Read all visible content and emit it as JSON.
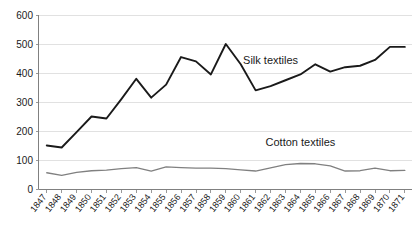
{
  "chart_data": {
    "type": "line",
    "title": "",
    "subtitle": "",
    "xlabel": "",
    "ylabel": "",
    "ylim": [
      0,
      600
    ],
    "ytick_values": [
      0,
      100,
      200,
      300,
      400,
      500,
      600
    ],
    "ytick_labels": [
      "0",
      "100",
      "200",
      "300",
      "400",
      "500",
      "600"
    ],
    "grid": "horizontal",
    "legend_position": "inline-annotation",
    "x": [
      1847,
      1848,
      1849,
      1850,
      1851,
      1852,
      1853,
      1854,
      1855,
      1856,
      1857,
      1858,
      1859,
      1860,
      1861,
      1862,
      1863,
      1864,
      1865,
      1866,
      1867,
      1868,
      1869,
      1870,
      1871
    ],
    "categories": [
      "1847",
      "1848",
      "1849",
      "1850",
      "1851",
      "1852",
      "1853",
      "1854",
      "1855",
      "1856",
      "1857",
      "1858",
      "1859",
      "1860",
      "1861",
      "1862",
      "1863",
      "1864",
      "1865",
      "1866",
      "1867",
      "1868",
      "1869",
      "1870",
      "1871"
    ],
    "series": [
      {
        "name": "Silk textiles",
        "color": "#1a1a1a",
        "label_x": 1862,
        "label_y": 430,
        "values": [
          150,
          143,
          196,
          250,
          243,
          310,
          380,
          315,
          360,
          455,
          440,
          395,
          500,
          430,
          340,
          355,
          375,
          395,
          430,
          405,
          420,
          425,
          445,
          490,
          490
        ]
      },
      {
        "name": "Cotton textiles",
        "color": "#808080",
        "label_x": 1864,
        "label_y": 150,
        "values": [
          56,
          47,
          57,
          63,
          65,
          70,
          74,
          62,
          76,
          74,
          72,
          72,
          70,
          66,
          62,
          73,
          84,
          88,
          87,
          80,
          62,
          63,
          72,
          63,
          64
        ]
      }
    ],
    "annotations": [
      {
        "text": "Silk textiles",
        "name": "silk-series-label"
      },
      {
        "text": "Cotton textiles",
        "name": "cotton-series-label"
      }
    ],
    "colors": {
      "background": "#ffffff",
      "gridline": "#d9d9d9",
      "axis": "#808080",
      "silk": "#1a1a1a",
      "cotton": "#808080",
      "text": "#1a1a1a"
    }
  }
}
